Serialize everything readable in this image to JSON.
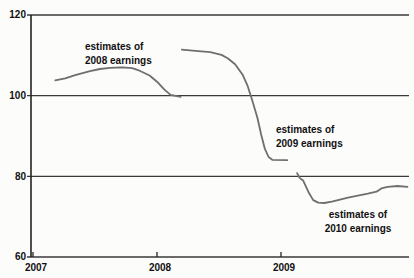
{
  "title": "S&P 500 Next Year Earnings Estimates",
  "colors": {
    "line": "#6f6f6f",
    "grid": "#3a3a3a",
    "axis": "#222222",
    "text": "#111111",
    "background": "#fcfcfb"
  },
  "chart_data": {
    "type": "line",
    "title": "S&P 500 Next Year Earnings Estimates",
    "xlabel": "",
    "ylabel": "",
    "xlim": [
      2007,
      2010.05
    ],
    "ylim": [
      60,
      120
    ],
    "x_ticks": [
      2007,
      2008,
      2009
    ],
    "y_ticks": [
      120,
      100,
      80,
      60
    ],
    "grid": "horizontal gridlines at each y tick",
    "legend": "none (inline annotations next to each line)",
    "series": [
      {
        "name": "estimates of 2008 earnings",
        "x": [
          2007.18,
          2007.26,
          2007.34,
          2007.46,
          2007.54,
          2007.62,
          2007.72,
          2007.8,
          2007.86,
          2007.94,
          2008.01,
          2008.06,
          2008.11,
          2008.19
        ],
        "values": [
          103.8,
          104.3,
          105.1,
          106.1,
          106.6,
          106.9,
          107.0,
          106.8,
          106.2,
          105.0,
          103.2,
          101.5,
          100.2,
          99.7
        ]
      },
      {
        "name": "estimates of 2009 earnings",
        "x": [
          2008.2,
          2008.31,
          2008.43,
          2008.52,
          2008.57,
          2008.63,
          2008.69,
          2008.73,
          2008.77,
          2008.81,
          2008.84,
          2008.87,
          2008.9,
          2008.93,
          2009.05
        ],
        "values": [
          111.4,
          111.1,
          110.8,
          110.1,
          109.3,
          107.8,
          105.2,
          102.5,
          98.6,
          94.5,
          90.3,
          86.8,
          84.8,
          84.1,
          84.0
        ]
      },
      {
        "name": "estimates of 2010 earnings",
        "x": [
          2009.13,
          2009.15,
          2009.18,
          2009.22,
          2009.26,
          2009.3,
          2009.35,
          2009.41,
          2009.46,
          2009.54,
          2009.62,
          2009.7,
          2009.77,
          2009.81,
          2009.86,
          2009.94,
          2010.02
        ],
        "values": [
          80.8,
          79.6,
          78.9,
          76.2,
          74.1,
          73.5,
          73.4,
          73.7,
          74.1,
          74.7,
          75.2,
          75.7,
          76.2,
          77.0,
          77.4,
          77.6,
          77.4
        ]
      }
    ],
    "annotations": [
      {
        "lines": [
          "estimates of",
          "2008 earnings"
        ]
      },
      {
        "lines": [
          "estimates of",
          "2009 earnings"
        ]
      },
      {
        "lines": [
          "estimates of",
          "2010 earnings"
        ]
      }
    ]
  }
}
